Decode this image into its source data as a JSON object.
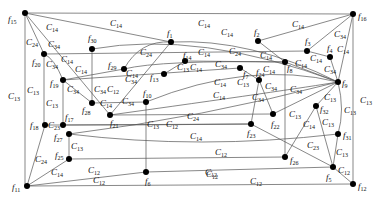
{
  "diagram": {
    "type": "graph",
    "frame": {
      "left": 25,
      "top": 13,
      "right": 353,
      "bottom": 186
    },
    "nodes": [
      {
        "id": "f15",
        "label": "f",
        "sub": "15",
        "x": 25,
        "y": 13,
        "lx": 8,
        "ly": 22
      },
      {
        "id": "f16",
        "label": "f",
        "sub": "16",
        "x": 353,
        "y": 14,
        "lx": 358,
        "ly": 19
      },
      {
        "id": "f1",
        "label": "f",
        "sub": "1",
        "x": 171,
        "y": 42,
        "lx": 167,
        "ly": 36
      },
      {
        "id": "f2",
        "label": "f",
        "sub": "2",
        "x": 258,
        "y": 41,
        "lx": 254,
        "ly": 35
      },
      {
        "id": "f30",
        "label": "f",
        "sub": "30",
        "x": 92,
        "y": 49,
        "lx": 88,
        "ly": 41
      },
      {
        "id": "f20",
        "label": "f",
        "sub": "20",
        "x": 44,
        "y": 54,
        "lx": 32,
        "ly": 65
      },
      {
        "id": "f3",
        "label": "f",
        "sub": "3",
        "x": 307,
        "y": 51,
        "lx": 305,
        "ly": 44
      },
      {
        "id": "f4",
        "label": "f",
        "sub": "4",
        "x": 330,
        "y": 57,
        "lx": 327,
        "ly": 51
      },
      {
        "id": "f14",
        "label": "f",
        "sub": "14",
        "x": 185,
        "y": 61,
        "lx": 183,
        "ly": 58
      },
      {
        "id": "f29",
        "label": "f",
        "sub": "29",
        "x": 124,
        "y": 69,
        "lx": 108,
        "ly": 68
      },
      {
        "id": "f13",
        "label": "f",
        "sub": "13",
        "x": 164,
        "y": 74,
        "lx": 150,
        "ly": 80
      },
      {
        "id": "f8",
        "label": "f",
        "sub": "8",
        "x": 285,
        "y": 62,
        "lx": 287,
        "ly": 71
      },
      {
        "id": "f7",
        "label": "f",
        "sub": "7",
        "x": 240,
        "y": 68,
        "lx": 243,
        "ly": 77
      },
      {
        "id": "f24",
        "label": "f",
        "sub": "24",
        "x": 259,
        "y": 80,
        "lx": 256,
        "ly": 75
      },
      {
        "id": "f9",
        "label": "f",
        "sub": "9",
        "x": 338,
        "y": 82,
        "lx": 342,
        "ly": 86
      },
      {
        "id": "f19",
        "label": "f",
        "sub": "19",
        "x": 63,
        "y": 80,
        "lx": 50,
        "ly": 86
      },
      {
        "id": "f28",
        "label": "f",
        "sub": "28",
        "x": 92,
        "y": 103,
        "lx": 82,
        "ly": 113
      },
      {
        "id": "f10",
        "label": "f",
        "sub": "10",
        "x": 146,
        "y": 102,
        "lx": 143,
        "ly": 96
      },
      {
        "id": "f21",
        "label": "f",
        "sub": "21",
        "x": 110,
        "y": 115,
        "lx": 110,
        "ly": 126
      },
      {
        "id": "f18",
        "label": "f",
        "sub": "18",
        "x": 45,
        "y": 125,
        "lx": 30,
        "ly": 128
      },
      {
        "id": "f17",
        "label": "f",
        "sub": "17",
        "x": 63,
        "y": 125,
        "lx": 65,
        "ly": 120
      },
      {
        "id": "f32",
        "label": "f",
        "sub": "32",
        "x": 316,
        "y": 106,
        "lx": 320,
        "ly": 112
      },
      {
        "id": "f22",
        "label": "f",
        "sub": "22",
        "x": 273,
        "y": 114,
        "lx": 271,
        "ly": 127
      },
      {
        "id": "f23",
        "label": "f",
        "sub": "23",
        "x": 251,
        "y": 124,
        "lx": 247,
        "ly": 136
      },
      {
        "id": "f27",
        "label": "f",
        "sub": "27",
        "x": 69,
        "y": 134,
        "lx": 54,
        "ly": 140
      },
      {
        "id": "f31",
        "label": "f",
        "sub": "31",
        "x": 338,
        "y": 134,
        "lx": 343,
        "ly": 138
      },
      {
        "id": "f26",
        "label": "f",
        "sub": "26",
        "x": 285,
        "y": 157,
        "lx": 290,
        "ly": 163
      },
      {
        "id": "f25",
        "label": "f",
        "sub": "25",
        "x": 69,
        "y": 159,
        "lx": 55,
        "ly": 158
      },
      {
        "id": "f5",
        "label": "f",
        "sub": "5",
        "x": 333,
        "y": 167,
        "lx": 326,
        "ly": 180
      },
      {
        "id": "f6",
        "label": "f",
        "sub": "6",
        "x": 146,
        "y": 172,
        "lx": 145,
        "ly": 184
      },
      {
        "id": "f11",
        "label": "f",
        "sub": "11",
        "x": 27,
        "y": 186,
        "lx": 12,
        "ly": 190
      },
      {
        "id": "f12",
        "label": "f",
        "sub": "12",
        "x": 353,
        "y": 184,
        "lx": 358,
        "ly": 189
      }
    ],
    "edges": [
      {
        "d": "M25 13 L353 14"
      },
      {
        "d": "M25 13 L25 186"
      },
      {
        "d": "M353 14 L353 184"
      },
      {
        "d": "M27 186 L353 184"
      },
      {
        "d": "M25 13 L171 42"
      },
      {
        "d": "M25 13 L44 54"
      },
      {
        "d": "M25 13 L110 115"
      },
      {
        "d": "M353 14 L258 41"
      },
      {
        "d": "M353 14 L307 51"
      },
      {
        "d": "M353 14 L338 82"
      },
      {
        "d": "M44 54 L307 51"
      },
      {
        "d": "M44 54 Q54 58 63 80"
      },
      {
        "d": "M44 54 L44 125"
      },
      {
        "d": "M92 49 L92 103"
      },
      {
        "d": "M92 49 Q200 30 338 82"
      },
      {
        "d": "M63 80 L124 69"
      },
      {
        "d": "M63 80 L63 125"
      },
      {
        "d": "M63 80 L92 103"
      },
      {
        "d": "M63 80 L240 68"
      },
      {
        "d": "M124 69 Q140 40 171 42"
      },
      {
        "d": "M124 69 Q160 60 285 62"
      },
      {
        "d": "M171 42 L110 115"
      },
      {
        "d": "M171 42 Q250 38 338 82"
      },
      {
        "d": "M164 74 L185 61"
      },
      {
        "d": "M185 61 L285 62"
      },
      {
        "d": "M258 41 L285 62"
      },
      {
        "d": "M307 51 L330 57"
      },
      {
        "d": "M330 57 L338 82"
      },
      {
        "d": "M285 62 L338 82"
      },
      {
        "d": "M92 103 L146 102"
      },
      {
        "d": "M146 102 L146 172"
      },
      {
        "d": "M146 102 Q250 60 338 82"
      },
      {
        "d": "M110 115 L273 114"
      },
      {
        "d": "M240 68 L259 80"
      },
      {
        "d": "M259 80 L251 124"
      },
      {
        "d": "M259 80 L273 114"
      },
      {
        "d": "M285 62 L285 157"
      },
      {
        "d": "M338 82 L273 114"
      },
      {
        "d": "M338 82 Q290 90 110 115"
      },
      {
        "d": "M338 82 L316 106"
      },
      {
        "d": "M338 82 Q345 110 338 134"
      },
      {
        "d": "M316 106 L285 157"
      },
      {
        "d": "M316 106 L333 167"
      },
      {
        "d": "M338 134 L333 167"
      },
      {
        "d": "M338 134 Q200 150 69 134"
      },
      {
        "d": "M63 125 Q160 125 251 124"
      },
      {
        "d": "M45 125 L63 125"
      },
      {
        "d": "M45 125 L27 186"
      },
      {
        "d": "M69 134 L69 159"
      },
      {
        "d": "M69 134 Q200 118 338 82"
      },
      {
        "d": "M251 124 L333 167"
      },
      {
        "d": "M69 159 L285 157"
      },
      {
        "d": "M69 159 L27 186"
      },
      {
        "d": "M27 186 L146 172"
      },
      {
        "d": "M146 172 L333 167"
      },
      {
        "d": "M333 167 L353 184"
      },
      {
        "d": "M63 125 L251 124"
      }
    ],
    "edge_labels": [
      {
        "text": "C",
        "sub": "14",
        "x": 110,
        "y": 26
      },
      {
        "text": "C",
        "sub": "14",
        "x": 198,
        "y": 26
      },
      {
        "text": "C",
        "sub": "14",
        "x": 292,
        "y": 27
      },
      {
        "text": "C",
        "sub": "14",
        "x": 46,
        "y": 30
      },
      {
        "text": "C",
        "sub": "24",
        "x": 26,
        "y": 45
      },
      {
        "text": "C",
        "sub": "34",
        "x": 48,
        "y": 47
      },
      {
        "text": "C",
        "sub": "14",
        "x": 221,
        "y": 35
      },
      {
        "text": "C",
        "sub": "34",
        "x": 334,
        "y": 37
      },
      {
        "text": "C",
        "sub": "14",
        "x": 337,
        "y": 52
      },
      {
        "text": "C",
        "sub": "24",
        "x": 140,
        "y": 55
      },
      {
        "text": "C",
        "sub": "14",
        "x": 198,
        "y": 55
      },
      {
        "text": "C",
        "sub": "24",
        "x": 229,
        "y": 54
      },
      {
        "text": "C",
        "sub": "14",
        "x": 260,
        "y": 58
      },
      {
        "text": "C",
        "sub": "14",
        "x": 310,
        "y": 61
      },
      {
        "text": "C",
        "sub": "34",
        "x": 46,
        "y": 67
      },
      {
        "text": "C",
        "sub": "14",
        "x": 61,
        "y": 62
      },
      {
        "text": "C",
        "sub": "14",
        "x": 75,
        "y": 72
      },
      {
        "text": "C",
        "sub": "14",
        "x": 126,
        "y": 76
      },
      {
        "text": "C",
        "sub": "13",
        "x": 177,
        "y": 70
      },
      {
        "text": "C",
        "sub": "14",
        "x": 190,
        "y": 70
      },
      {
        "text": "C",
        "sub": "34",
        "x": 215,
        "y": 67
      },
      {
        "text": "C",
        "sub": "14",
        "x": 263,
        "y": 72
      },
      {
        "text": "C",
        "sub": "14",
        "x": 295,
        "y": 66
      },
      {
        "text": "C",
        "sub": "34",
        "x": 324,
        "y": 72
      },
      {
        "text": "C",
        "sub": "13",
        "x": 8,
        "y": 99
      },
      {
        "text": "C",
        "sub": "13",
        "x": 27,
        "y": 93
      },
      {
        "text": "C",
        "sub": "13",
        "x": 46,
        "y": 106
      },
      {
        "text": "C",
        "sub": "34",
        "x": 67,
        "y": 92
      },
      {
        "text": "C",
        "sub": "34",
        "x": 94,
        "y": 92
      },
      {
        "text": "C",
        "sub": "12",
        "x": 107,
        "y": 92
      },
      {
        "text": "C",
        "sub": "14",
        "x": 100,
        "y": 106
      },
      {
        "text": "C",
        "sub": "34",
        "x": 122,
        "y": 104
      },
      {
        "text": "C",
        "sub": "34",
        "x": 125,
        "y": 82
      },
      {
        "text": "C",
        "sub": "14",
        "x": 213,
        "y": 98
      },
      {
        "text": "C",
        "sub": "14",
        "x": 214,
        "y": 85
      },
      {
        "text": "C",
        "sub": "13",
        "x": 237,
        "y": 85
      },
      {
        "text": "C",
        "sub": "34",
        "x": 265,
        "y": 89
      },
      {
        "text": "C",
        "sub": "34",
        "x": 290,
        "y": 92
      },
      {
        "text": "C",
        "sub": "34",
        "x": 252,
        "y": 100
      },
      {
        "text": "C",
        "sub": "13",
        "x": 324,
        "y": 100
      },
      {
        "text": "C",
        "sub": "13",
        "x": 360,
        "y": 103
      },
      {
        "text": "C",
        "sub": "13",
        "x": 344,
        "y": 113
      },
      {
        "text": "C",
        "sub": "23",
        "x": 48,
        "y": 128
      },
      {
        "text": "C",
        "sub": "13",
        "x": 147,
        "y": 127
      },
      {
        "text": "C",
        "sub": "12",
        "x": 166,
        "y": 127
      },
      {
        "text": "C",
        "sub": "24",
        "x": 187,
        "y": 119
      },
      {
        "text": "C",
        "sub": "14",
        "x": 190,
        "y": 139
      },
      {
        "text": "C",
        "sub": "13",
        "x": 289,
        "y": 117
      },
      {
        "text": "C",
        "sub": "14",
        "x": 303,
        "y": 127
      },
      {
        "text": "C",
        "sub": "13",
        "x": 322,
        "y": 125
      },
      {
        "text": "C",
        "sub": "12",
        "x": 215,
        "y": 155
      },
      {
        "text": "C",
        "sub": "23",
        "x": 307,
        "y": 148
      },
      {
        "text": "C",
        "sub": "13",
        "x": 336,
        "y": 155
      },
      {
        "text": "C",
        "sub": "13",
        "x": 71,
        "y": 149
      },
      {
        "text": "C",
        "sub": "24",
        "x": 35,
        "y": 162
      },
      {
        "text": "C",
        "sub": "14",
        "x": 51,
        "y": 175
      },
      {
        "text": "C",
        "sub": "12",
        "x": 88,
        "y": 173
      },
      {
        "text": "C",
        "sub": "12",
        "x": 205,
        "y": 175
      },
      {
        "text": "C",
        "sub": "12",
        "x": 338,
        "y": 173
      },
      {
        "text": "C",
        "sub": "12",
        "x": 206,
        "y": 177
      },
      {
        "text": "C",
        "sub": "12",
        "x": 93,
        "y": 183
      },
      {
        "text": "C",
        "sub": "12",
        "x": 250,
        "y": 184
      }
    ]
  }
}
